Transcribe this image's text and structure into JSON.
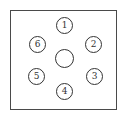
{
  "diagram": {
    "type": "circle-arrangement",
    "frame": {
      "shape": "square",
      "border_color": "#4a4a4a"
    },
    "center_node": {
      "label": ""
    },
    "nodes": [
      {
        "id": 1,
        "label": "1",
        "position": "top"
      },
      {
        "id": 2,
        "label": "2",
        "position": "upper-right"
      },
      {
        "id": 3,
        "label": "3",
        "position": "lower-right"
      },
      {
        "id": 4,
        "label": "4",
        "position": "bottom"
      },
      {
        "id": 5,
        "label": "5",
        "position": "lower-left"
      },
      {
        "id": 6,
        "label": "6",
        "position": "upper-left"
      }
    ]
  }
}
